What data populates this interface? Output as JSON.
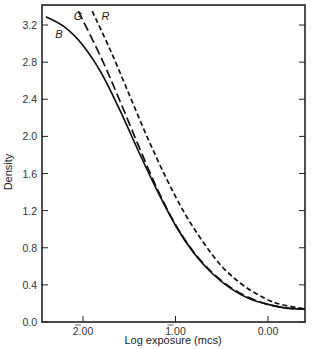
{
  "chart_data": {
    "type": "line",
    "title": "",
    "xlabel": "Log exposure (mcs)",
    "ylabel": "Density",
    "xlim": [
      2.4,
      -0.4
    ],
    "ylim": [
      0.0,
      3.4
    ],
    "x_reversed": true,
    "grid": false,
    "xticks": [
      {
        "value": 2.0,
        "label": "2.00",
        "bar_notation": true
      },
      {
        "value": 1.0,
        "label": "1.00",
        "bar_notation": true
      },
      {
        "value": 0.0,
        "label": "0.00",
        "bar_notation": false
      }
    ],
    "yticks": [
      "0.0",
      "0.4",
      "0.8",
      "1.2",
      "1.6",
      "2.0",
      "2.4",
      "2.8",
      "3.2"
    ],
    "series": [
      {
        "name": "B",
        "style": "solid",
        "x": [
          2.4,
          2.2,
          2.0,
          1.8,
          1.6,
          1.4,
          1.2,
          1.0,
          0.8,
          0.6,
          0.4,
          0.2,
          0.0,
          -0.2,
          -0.4
        ],
        "y": [
          3.29,
          3.18,
          2.98,
          2.68,
          2.28,
          1.84,
          1.42,
          1.04,
          0.74,
          0.52,
          0.36,
          0.25,
          0.19,
          0.15,
          0.14
        ]
      },
      {
        "name": "G",
        "style": "long-dash",
        "x": [
          2.05,
          1.8,
          1.6,
          1.4,
          1.2,
          1.0,
          0.8,
          0.6,
          0.4,
          0.2,
          0.0,
          -0.2,
          -0.4
        ],
        "y": [
          3.35,
          2.84,
          2.38,
          1.9,
          1.44,
          1.05,
          0.75,
          0.53,
          0.37,
          0.26,
          0.19,
          0.15,
          0.14
        ]
      },
      {
        "name": "R",
        "style": "short-dash",
        "x": [
          1.9,
          1.7,
          1.5,
          1.3,
          1.1,
          0.9,
          0.7,
          0.5,
          0.3,
          0.1,
          -0.1,
          -0.4
        ],
        "y": [
          3.35,
          2.92,
          2.45,
          1.98,
          1.55,
          1.17,
          0.86,
          0.6,
          0.42,
          0.29,
          0.2,
          0.14
        ]
      }
    ],
    "annotations": [
      {
        "text": "B",
        "x": 2.3,
        "y": 3.1
      },
      {
        "text": "G",
        "x": 2.1,
        "y": 3.3
      },
      {
        "text": "R",
        "x": 1.8,
        "y": 3.3
      }
    ]
  }
}
